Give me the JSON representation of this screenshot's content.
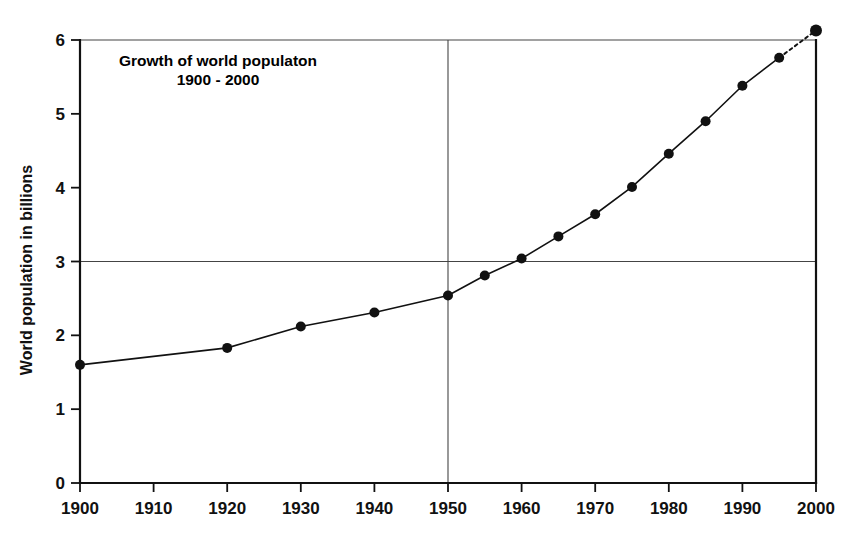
{
  "chart_data": {
    "type": "line",
    "title": "Growth of world populaton",
    "subtitle": "1900 - 2000",
    "xlabel": "",
    "ylabel": "World population in billions",
    "xlim": [
      1900,
      2000
    ],
    "ylim": [
      0,
      6
    ],
    "grid": "partial",
    "legend": "none",
    "x_ticks": [
      "1900",
      "1910",
      "1920",
      "1930",
      "1940",
      "1950",
      "1960",
      "1970",
      "1980",
      "1990",
      "2000"
    ],
    "x_tick_values": [
      1900,
      1910,
      1920,
      1930,
      1940,
      1950,
      1960,
      1970,
      1980,
      1990,
      2000
    ],
    "y_ticks": [
      "0",
      "1",
      "2",
      "3",
      "4",
      "5",
      "6"
    ],
    "y_tick_values": [
      0,
      1,
      2,
      3,
      4,
      5,
      6
    ],
    "gridlines": {
      "horizontal": [
        3,
        6
      ],
      "vertical": [
        1950,
        2000
      ]
    },
    "x": [
      1900,
      1920,
      1930,
      1940,
      1950,
      1955,
      1960,
      1965,
      1970,
      1975,
      1980,
      1985,
      1990,
      1995,
      2000
    ],
    "values": [
      1.6,
      1.83,
      2.12,
      2.31,
      2.54,
      2.81,
      3.04,
      3.34,
      3.64,
      4.01,
      4.46,
      4.9,
      5.38,
      5.76,
      6.13
    ],
    "series": [
      {
        "name": "World population",
        "x": [
          1900,
          1920,
          1930,
          1940,
          1950,
          1955,
          1960,
          1965,
          1970,
          1975,
          1980,
          1985,
          1990,
          1995,
          2000
        ],
        "values": [
          1.6,
          1.83,
          2.12,
          2.31,
          2.54,
          2.81,
          3.04,
          3.34,
          3.64,
          4.01,
          4.46,
          4.9,
          5.38,
          5.76,
          6.13
        ]
      }
    ],
    "projected_from": 1995,
    "projected_to": 2000,
    "colors": {
      "line": "#111111",
      "marker": "#111111",
      "grid": "#444444",
      "axis": "#111111",
      "background": "#ffffff"
    }
  }
}
